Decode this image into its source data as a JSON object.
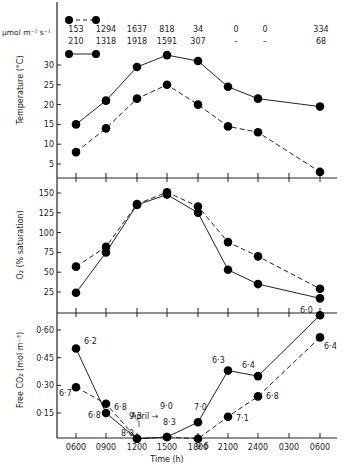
{
  "chart_data": [
    {
      "type": "line",
      "title": "",
      "ylabel": "Temperature (°C)",
      "yticks": [
        5,
        10,
        15,
        20,
        25,
        30
      ],
      "ylim": [
        0,
        35
      ],
      "categories": [
        "0600",
        "0900",
        "1200",
        "1500",
        "1800",
        "2100",
        "2400",
        "0300",
        "0600"
      ],
      "series": [
        {
          "name": "solid",
          "style": "solid",
          "x_index": [
            0,
            1,
            2,
            3,
            4,
            5,
            6,
            8
          ],
          "values": [
            15,
            21,
            29.5,
            32.5,
            31,
            24.5,
            21.5,
            19.5
          ]
        },
        {
          "name": "dashed",
          "style": "dashed",
          "x_index": [
            0,
            1,
            2,
            3,
            4,
            5,
            6,
            8
          ],
          "values": [
            8,
            14,
            21.5,
            25,
            20,
            14.5,
            13,
            3
          ]
        }
      ],
      "irradiance": {
        "unit": "µmol m⁻² s⁻¹",
        "dashed_row": [
          "153",
          "1294",
          "1637",
          "818",
          "34",
          "0",
          "0",
          "334"
        ],
        "solid_row": [
          "210",
          "1318",
          "1918",
          "1591",
          "307",
          "–",
          "–",
          "68"
        ]
      }
    },
    {
      "type": "line",
      "ylabel": "O₂ (% saturation)",
      "yticks": [
        25,
        50,
        75,
        100,
        125,
        150
      ],
      "ylim": [
        0,
        160
      ],
      "categories": [
        "0600",
        "0900",
        "1200",
        "1500",
        "1800",
        "2100",
        "2400",
        "0300",
        "0600"
      ],
      "series": [
        {
          "name": "solid",
          "style": "solid",
          "x_index": [
            0,
            1,
            2,
            3,
            4,
            5,
            6,
            8
          ],
          "values": [
            24,
            75,
            135,
            148,
            125,
            53,
            35,
            17
          ]
        },
        {
          "name": "dashed",
          "style": "dashed",
          "x_index": [
            0,
            1,
            2,
            3,
            4,
            5,
            6,
            8
          ],
          "values": [
            57,
            82,
            136,
            151,
            133,
            88,
            70,
            29
          ]
        }
      ]
    },
    {
      "type": "line",
      "ylabel": "Free CO₂ (mol m⁻³)",
      "xlabel": "Time (h)",
      "yticks": [
        "0·15",
        "0·30",
        "0·45",
        "0·60"
      ],
      "ylim": [
        0,
        0.7
      ],
      "categories": [
        "0600",
        "0900",
        "1200",
        "1500",
        "1800",
        "2100",
        "2400",
        "0300",
        "0600"
      ],
      "series": [
        {
          "name": "solid",
          "style": "solid",
          "x_index": [
            0,
            1,
            2,
            3,
            4,
            5,
            6,
            8
          ],
          "values": [
            0.5,
            0.15,
            0.01,
            0.02,
            0.1,
            0.38,
            0.35,
            0.68
          ],
          "pH_labels": [
            "6·2",
            "6·8",
            "9·3",
            "8·3",
            "7·0",
            "6·3",
            "6·4",
            "6·0"
          ]
        },
        {
          "name": "dashed",
          "style": "dashed",
          "x_index": [
            0,
            1,
            2,
            3,
            4,
            5,
            6,
            8
          ],
          "values": [
            0.29,
            0.2,
            0.01,
            0.02,
            0.01,
            0.13,
            0.24,
            0.56
          ],
          "pH_labels": [
            "6·7",
            "6·8",
            "8·0",
            "9·0",
            "9·6",
            "7·1",
            "6·8",
            "6·4"
          ]
        }
      ],
      "annotations": [
        {
          "text": "April →",
          "points_to": "9·0"
        }
      ]
    }
  ],
  "labels": {
    "unit": "µmol m⁻² s⁻¹",
    "temp_ylabel": "Temperature (°C)",
    "o2_ylabel": "O₂ (% saturation)",
    "co2_ylabel": "Free CO₂ (mol m⁻³)",
    "xlabel": "Time (h)",
    "april": "April"
  }
}
